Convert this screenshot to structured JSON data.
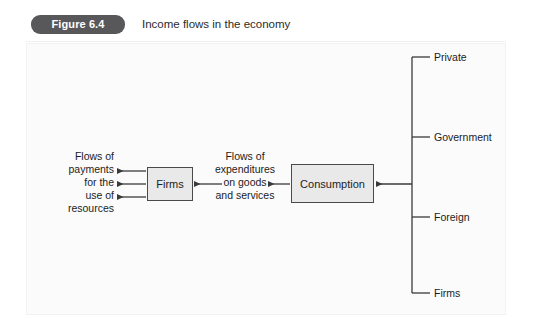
{
  "header": {
    "badge_label": "Figure 6.4",
    "title": "Income flows in the economy",
    "badge_color": "#58585a",
    "badge_text_color": "#ffffff",
    "title_color": "#2b2b2b"
  },
  "panel": {
    "background": "#fbfbfc",
    "border_color": "#f2f2f4"
  },
  "diagram": {
    "type": "flow-diagram",
    "line_color": "#3a3a3a",
    "box_fill": "#e9e9ea",
    "box_border": "#4a4a4a",
    "nodes": [
      {
        "id": "firms",
        "label": "Firms"
      },
      {
        "id": "consumption",
        "label": "Consumption"
      }
    ],
    "flow_labels": [
      {
        "id": "payments",
        "text": "Flows of\npayments\nfor the\nuse of\nresources",
        "align": "right"
      },
      {
        "id": "expenditures",
        "text": "Flows of\nexpenditures\non goods\nand services",
        "align": "center"
      }
    ],
    "branches": [
      {
        "label": "Private"
      },
      {
        "label": "Government"
      },
      {
        "label": "Foreign"
      },
      {
        "label": "Firms"
      }
    ]
  }
}
